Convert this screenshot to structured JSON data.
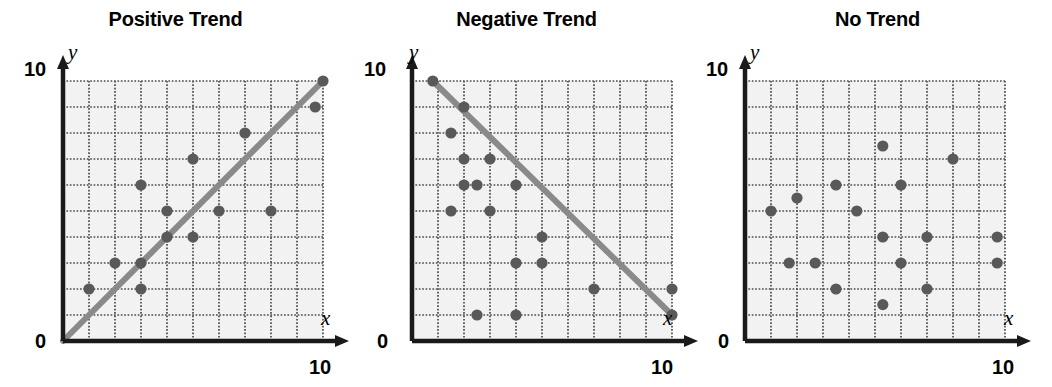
{
  "figure": {
    "width": 1052,
    "height": 387,
    "background": "#ffffff",
    "panel_count": 3
  },
  "style": {
    "point_color": "#595959",
    "line_color": "#8a8a8a",
    "grid_color": "#4d4d4d",
    "axis_color": "#1a1a1a",
    "plot_background": "#f2f2f2",
    "title_color": "#000000"
  },
  "panels": [
    {
      "id": "positive-trend",
      "title": "Positive Trend",
      "x_axis_label": "x",
      "y_axis_label": "y",
      "origin_label": "0",
      "x_max_label": "10",
      "y_max_label": "10"
    },
    {
      "id": "negative-trend",
      "title": "Negative Trend",
      "x_axis_label": "x",
      "y_axis_label": "y",
      "origin_label": "0",
      "x_max_label": "10",
      "y_max_label": "10"
    },
    {
      "id": "no-trend",
      "title": "No Trend",
      "x_axis_label": "x",
      "y_axis_label": "y",
      "origin_label": "0",
      "x_max_label": "10",
      "y_max_label": "10"
    }
  ],
  "chart_data": [
    {
      "type": "scatter",
      "title": "Positive Trend",
      "xlabel": "x",
      "ylabel": "y",
      "xlim": [
        0,
        10
      ],
      "ylim": [
        0,
        10
      ],
      "xticks": [
        0,
        10
      ],
      "yticks": [
        0,
        10
      ],
      "grid": true,
      "grid_step": 1,
      "points": [
        {
          "x": 1,
          "y": 2
        },
        {
          "x": 2,
          "y": 3
        },
        {
          "x": 3,
          "y": 3
        },
        {
          "x": 3,
          "y": 2
        },
        {
          "x": 3,
          "y": 6
        },
        {
          "x": 4,
          "y": 4
        },
        {
          "x": 4,
          "y": 5
        },
        {
          "x": 5,
          "y": 7
        },
        {
          "x": 5,
          "y": 4
        },
        {
          "x": 6,
          "y": 5
        },
        {
          "x": 7,
          "y": 8
        },
        {
          "x": 8,
          "y": 5
        },
        {
          "x": 9.7,
          "y": 9
        },
        {
          "x": 10,
          "y": 10
        }
      ],
      "trendline": {
        "x0": 0,
        "y0": 0,
        "x1": 10,
        "y1": 10,
        "slope": 1,
        "intercept": 0
      }
    },
    {
      "type": "scatter",
      "title": "Negative Trend",
      "xlabel": "x",
      "ylabel": "y",
      "xlim": [
        0,
        10
      ],
      "ylim": [
        0,
        10
      ],
      "xticks": [
        0,
        10
      ],
      "yticks": [
        0,
        10
      ],
      "grid": true,
      "grid_step": 1,
      "points": [
        {
          "x": 0.8,
          "y": 10
        },
        {
          "x": 2,
          "y": 9
        },
        {
          "x": 1.5,
          "y": 8
        },
        {
          "x": 2,
          "y": 7
        },
        {
          "x": 3,
          "y": 7
        },
        {
          "x": 2,
          "y": 6
        },
        {
          "x": 2.5,
          "y": 6
        },
        {
          "x": 4,
          "y": 6
        },
        {
          "x": 1.5,
          "y": 5
        },
        {
          "x": 3,
          "y": 5
        },
        {
          "x": 5,
          "y": 4
        },
        {
          "x": 5,
          "y": 3
        },
        {
          "x": 4,
          "y": 3
        },
        {
          "x": 7,
          "y": 2
        },
        {
          "x": 10,
          "y": 2
        },
        {
          "x": 2.5,
          "y": 1
        },
        {
          "x": 4,
          "y": 1
        },
        {
          "x": 10,
          "y": 1
        }
      ],
      "trendline": {
        "x0": 0.8,
        "y0": 10,
        "x1": 10,
        "y1": 1,
        "slope": -0.978,
        "intercept": 10.78
      }
    },
    {
      "type": "scatter",
      "title": "No Trend",
      "xlabel": "x",
      "ylabel": "y",
      "xlim": [
        0,
        10
      ],
      "ylim": [
        0,
        10
      ],
      "xticks": [
        0,
        10
      ],
      "yticks": [
        0,
        10
      ],
      "grid": true,
      "grid_step": 1,
      "points": [
        {
          "x": 5.3,
          "y": 7.5
        },
        {
          "x": 8,
          "y": 7
        },
        {
          "x": 3.5,
          "y": 6
        },
        {
          "x": 6,
          "y": 6
        },
        {
          "x": 2,
          "y": 5.5
        },
        {
          "x": 1,
          "y": 5
        },
        {
          "x": 4.3,
          "y": 5
        },
        {
          "x": 5.3,
          "y": 4
        },
        {
          "x": 7,
          "y": 4
        },
        {
          "x": 9.7,
          "y": 4
        },
        {
          "x": 1.7,
          "y": 3
        },
        {
          "x": 2.7,
          "y": 3
        },
        {
          "x": 6,
          "y": 3
        },
        {
          "x": 9.7,
          "y": 3
        },
        {
          "x": 3.5,
          "y": 2
        },
        {
          "x": 7,
          "y": 2
        },
        {
          "x": 5.3,
          "y": 1.4
        }
      ],
      "trendline": null
    }
  ]
}
